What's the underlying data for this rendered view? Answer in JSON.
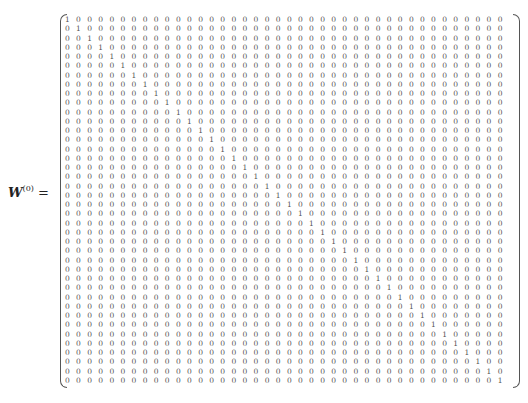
{
  "equation": {
    "symbol": "W",
    "superscript": "(0)",
    "equals": "=",
    "matrix_type": "identity",
    "size": 40
  }
}
